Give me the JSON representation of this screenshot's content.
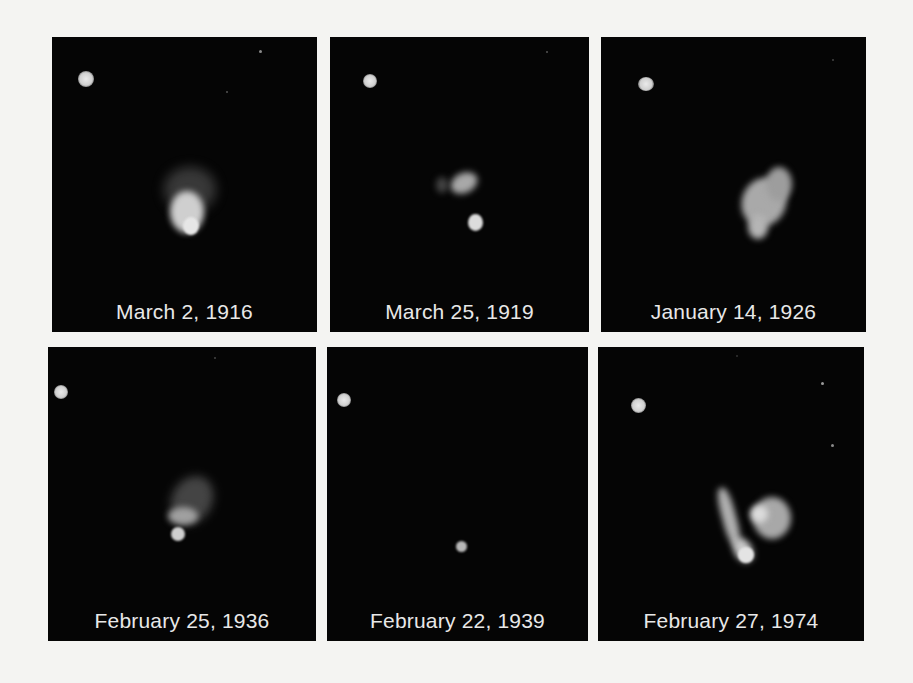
{
  "figure": {
    "panels": [
      {
        "caption": "March 2, 1916"
      },
      {
        "caption": "March 25, 1919"
      },
      {
        "caption": "January 14, 1926"
      },
      {
        "caption": "February 25, 1936"
      },
      {
        "caption": "February 22, 1939"
      },
      {
        "caption": "February 27, 1974"
      }
    ],
    "colors": {
      "background": "#f4f4f2",
      "panel": "#050505",
      "caption": "#e8e8e8"
    }
  }
}
